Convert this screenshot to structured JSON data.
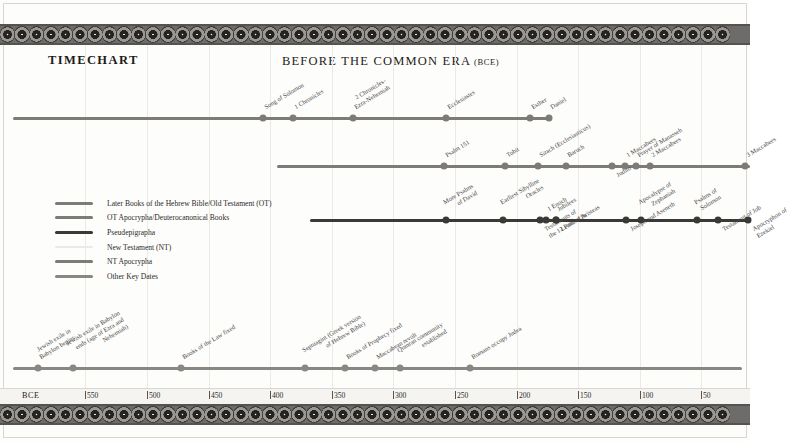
{
  "header": {
    "timechart_label": "TIMECHART",
    "era_title_main": "BEFORE THE COMMON ERA",
    "era_title_paren_open": "(",
    "era_title_abbrev": "BCE",
    "era_title_paren_close": ")"
  },
  "axis": {
    "origin_label": "BCE",
    "ticks": [
      {
        "label": "550",
        "x": 85
      },
      {
        "label": "500",
        "x": 147
      },
      {
        "label": "450",
        "x": 209
      },
      {
        "label": "400",
        "x": 270
      },
      {
        "label": "350",
        "x": 332
      },
      {
        "label": "300",
        "x": 393
      },
      {
        "label": "250",
        "x": 455
      },
      {
        "label": "200",
        "x": 517
      },
      {
        "label": "150",
        "x": 578
      },
      {
        "label": "100",
        "x": 640
      },
      {
        "label": "50",
        "x": 701
      }
    ]
  },
  "legend": {
    "items": [
      {
        "label": "Later Books of the Hebrew Bible/Old Testament (OT)",
        "color": "#7e7b77"
      },
      {
        "label": "OT Apocrypha/Deuterocanonical Books",
        "color": "#7e7b77"
      },
      {
        "label": "Pseudepigrapha",
        "color": "#3b3935"
      },
      {
        "label": "New Testament (NT)",
        "color": "#eceae6"
      },
      {
        "label": "NT Apocrypha",
        "color": "#7e7b77"
      },
      {
        "label": "Other Key Dates",
        "color": "#8a8783"
      }
    ]
  },
  "chart_data": {
    "type": "timeline",
    "title": "BEFORE THE COMMON ERA (BCE)",
    "xlabel": "BCE",
    "xlim": [
      575,
      0
    ],
    "grid": true,
    "legend_position": "left-middle",
    "series": [
      {
        "name": "Later Books of the Hebrew Bible/Old Testament (OT)",
        "color": "#7e7b77",
        "line_start_x": 13,
        "line_end_x": 550,
        "row_y": 118,
        "events": [
          {
            "label": "Song of Solomon",
            "x": 263,
            "side": "above"
          },
          {
            "label": "1 Chronicles",
            "x": 293,
            "side": "above"
          },
          {
            "label": "2 Chronicles-\nEzra-Nehemiah",
            "x": 353,
            "side": "above"
          },
          {
            "label": "Ecclesiastes",
            "x": 446,
            "side": "above"
          },
          {
            "label": "Esther",
            "x": 530,
            "side": "above"
          },
          {
            "label": "Daniel",
            "x": 549,
            "side": "above"
          }
        ]
      },
      {
        "name": "OT Apocrypha/Deuterocanonical Books",
        "color": "#7e7b77",
        "line_start_x": 277,
        "line_end_x": 750,
        "row_y": 166,
        "events": [
          {
            "label": "Psalm 151",
            "x": 444,
            "side": "above"
          },
          {
            "label": "Tobit",
            "x": 505,
            "side": "above"
          },
          {
            "label": "Sirach (Ecclesiasticus)",
            "x": 538,
            "side": "above"
          },
          {
            "label": "Baruch",
            "x": 566,
            "side": "above"
          },
          {
            "label": "Judith",
            "x": 612,
            "side": "below"
          },
          {
            "label": "1 Maccabees",
            "x": 625,
            "side": "above"
          },
          {
            "label": "Prayer of Manasseh",
            "x": 636,
            "side": "above"
          },
          {
            "label": "2 Maccabees",
            "x": 650,
            "side": "above"
          },
          {
            "label": "3 Maccabees",
            "x": 745,
            "side": "above"
          }
        ]
      },
      {
        "name": "Pseudepigrapha",
        "color": "#3b3935",
        "line_start_x": 310,
        "line_end_x": 750,
        "row_y": 220,
        "events": [
          {
            "label": "More Psalms\nof David",
            "x": 446,
            "side": "above"
          },
          {
            "label": "Earliest Sibylline\nOracles",
            "x": 503,
            "side": "above"
          },
          {
            "label": "1 Enoch",
            "x": 546,
            "side": "above"
          },
          {
            "label": "Jubilees",
            "x": 556,
            "side": "above"
          },
          {
            "label": "Testaments of\nthe 12 Patriarchs",
            "x": 540,
            "side": "below"
          },
          {
            "label": "Letter of Aristeas",
            "x": 556,
            "side": "below"
          },
          {
            "label": "Joseph and Aseneth",
            "x": 626,
            "side": "below"
          },
          {
            "label": "Apocalypse of\nZephaniah",
            "x": 641,
            "side": "above"
          },
          {
            "label": "Testament of Job",
            "x": 718,
            "side": "below"
          },
          {
            "label": "Psalms of\nSolomon",
            "x": 697,
            "side": "above"
          },
          {
            "label": "Apocryphon of\nEzekiel",
            "x": 748,
            "side": "below"
          }
        ]
      },
      {
        "name": "Other Key Dates",
        "color": "#8a8783",
        "line_start_x": 13,
        "line_end_x": 742,
        "row_y": 368,
        "events": [
          {
            "label": "Jewish exile in\nBabylon begins",
            "x": 38,
            "side": "above"
          },
          {
            "label": "Jewish exile in Babylon\nends (age of Ezra and\nNehemiah)",
            "x": 73,
            "side": "above"
          },
          {
            "label": "Books of the Law fixed",
            "x": 181,
            "side": "above"
          },
          {
            "label": "Septuagint (Greek version\nof Hebrew Bible)",
            "x": 305,
            "side": "above"
          },
          {
            "label": "Books of Prophecy fixed",
            "x": 345,
            "side": "above"
          },
          {
            "label": "Maccabean revolt",
            "x": 375,
            "side": "above"
          },
          {
            "label": "Qumran community\nestablished",
            "x": 400,
            "side": "above"
          },
          {
            "label": "Romans occupy Judea",
            "x": 470,
            "side": "above"
          }
        ]
      }
    ]
  }
}
